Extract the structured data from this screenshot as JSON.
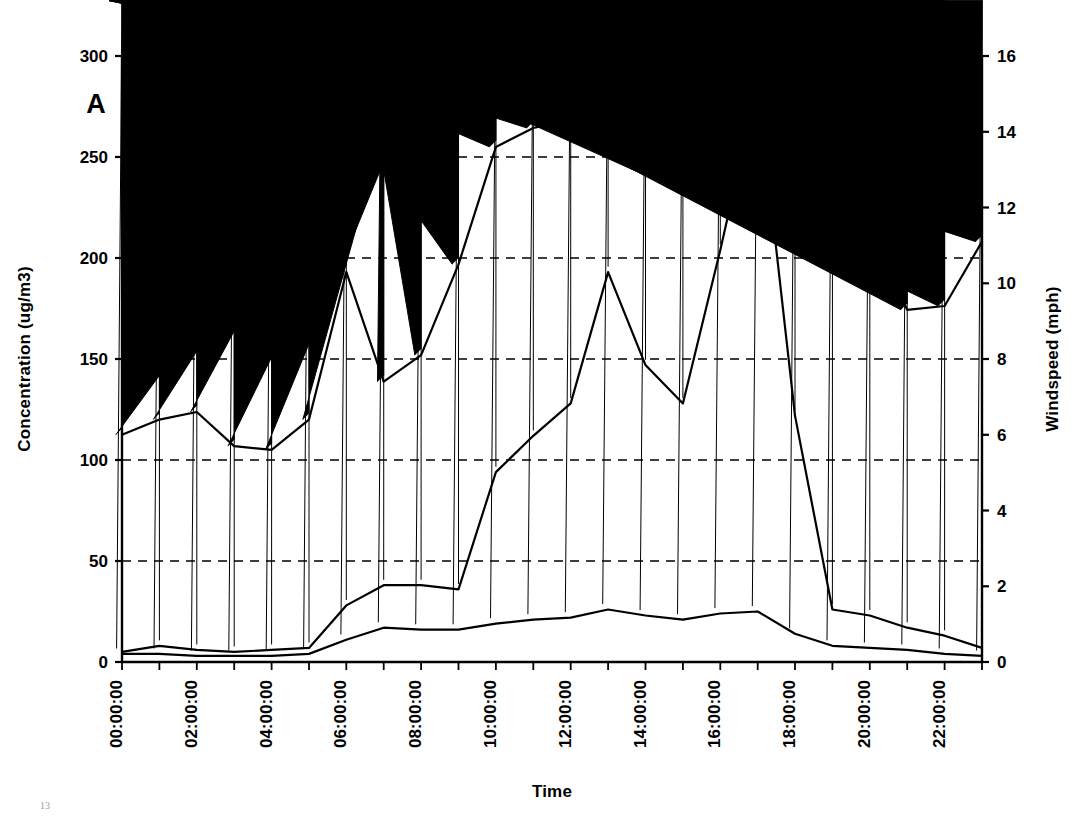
{
  "panel": {
    "letter": "A"
  },
  "axes": {
    "left_title": "Concentration (ug/m3)",
    "right_title": "Windspeed (mph)",
    "x_title": "Time",
    "left_ticks": [
      "0",
      "50",
      "100",
      "150",
      "200",
      "250",
      "300"
    ],
    "right_ticks": [
      "0",
      "2",
      "4",
      "6",
      "8",
      "10",
      "12",
      "14",
      "16"
    ],
    "x_ticks": [
      "00:00:00",
      "02:00:00",
      "04:00:00",
      "06:00:00",
      "08:00:00",
      "10:00:00",
      "12:00:00",
      "14:00:00",
      "16:00:00",
      "18:00:00",
      "20:00:00",
      "22:00:00"
    ]
  },
  "legend": {
    "items": [
      {
        "label": "PM10",
        "marker": "diamond"
      },
      {
        "label": "PM2.5",
        "marker": "square"
      },
      {
        "label": "Wind",
        "marker": "triangle"
      }
    ]
  },
  "chart_data": {
    "type": "line",
    "title": "",
    "subtitle": "",
    "xlabel": "Time",
    "ylabel": "Concentration (ug/m3)",
    "y2label": "Windspeed (mph)",
    "ylim": [
      0,
      300
    ],
    "y2lim": [
      0,
      16
    ],
    "ytick_step": 50,
    "y2tick_step": 2,
    "grid": "horizontal-dashed",
    "legend_position": "top-left-inside",
    "annotations": [
      "A"
    ],
    "x": [
      "00:00:00",
      "01:00:00",
      "02:00:00",
      "03:00:00",
      "04:00:00",
      "05:00:00",
      "06:00:00",
      "07:00:00",
      "08:00:00",
      "09:00:00",
      "10:00:00",
      "11:00:00",
      "12:00:00",
      "13:00:00",
      "14:00:00",
      "15:00:00",
      "16:00:00",
      "17:00:00",
      "18:00:00",
      "19:00:00",
      "20:00:00",
      "21:00:00",
      "22:00:00",
      "23:00:00"
    ],
    "xtick_labels": [
      "00:00:00",
      "02:00:00",
      "04:00:00",
      "06:00:00",
      "08:00:00",
      "10:00:00",
      "12:00:00",
      "14:00:00",
      "16:00:00",
      "18:00:00",
      "20:00:00",
      "22:00:00"
    ],
    "series": [
      {
        "name": "PM10",
        "axis": "left",
        "marker": "diamond",
        "units": "ug/m3",
        "values": [
          5,
          8,
          6,
          5,
          6,
          7,
          28,
          38,
          38,
          36,
          94,
          112,
          128,
          193,
          147,
          128,
          204,
          286,
          122,
          26,
          23,
          17,
          13,
          7
        ]
      },
      {
        "name": "PM2.5",
        "axis": "left",
        "marker": "square",
        "units": "ug/m3",
        "values": [
          4,
          4,
          3,
          3,
          3,
          4,
          11,
          17,
          16,
          16,
          19,
          21,
          22,
          26,
          23,
          21,
          24,
          25,
          14,
          8,
          7,
          6,
          4,
          3
        ]
      },
      {
        "name": "Wind",
        "axis": "right",
        "marker": "triangle",
        "units": "mph",
        "values": [
          6.0,
          6.4,
          6.6,
          5.7,
          5.6,
          6.4,
          10.3,
          7.4,
          8.1,
          10.5,
          13.6,
          14.1,
          14.3,
          14.6,
          14.6,
          14.6,
          14.3,
          14.5,
          14.0,
          10.7,
          11.4,
          9.3,
          9.4,
          11.1
        ]
      }
    ],
    "series_left_equivalent_note": {
      "Wind_as_left_scale": [
        113,
        120,
        124,
        107,
        105,
        120,
        193,
        139,
        151,
        196,
        255,
        264,
        268,
        273,
        273,
        273,
        268,
        272,
        262,
        200,
        214,
        174,
        176,
        208
      ]
    }
  }
}
